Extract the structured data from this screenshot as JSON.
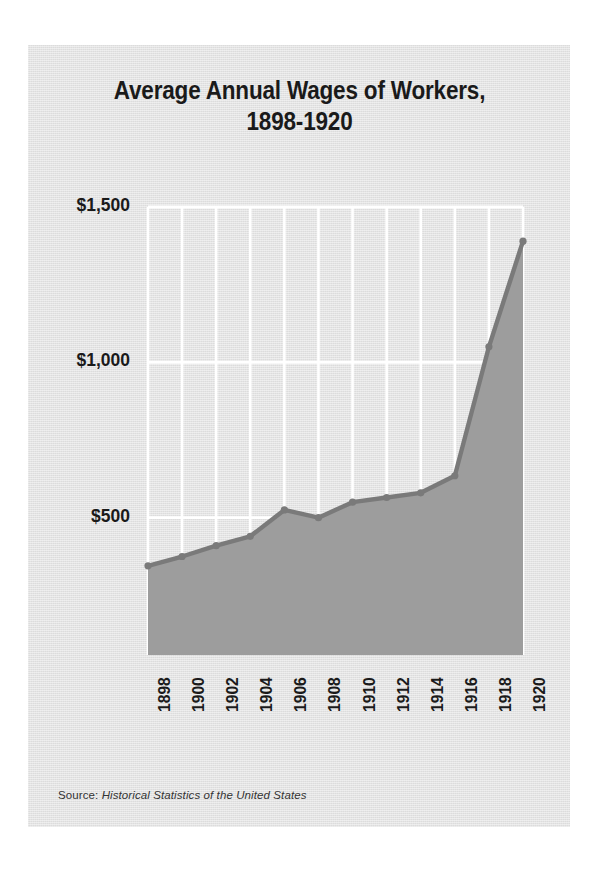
{
  "figure": {
    "title_line1": "Average Annual Wages of Workers,",
    "title_line2": "1898-1920",
    "title_full": "Average Annual Wages of Workers, 1898-1920",
    "source_prefix": "Source:",
    "source_work": "Historical Statistics of the United States",
    "background_color": "#e2e2e2",
    "page_color": "#ffffff",
    "series_line_color": "#7a7a7a",
    "series_fill_color": "#9d9d9d",
    "gridline_color": "#ffffff",
    "text_color": "#1a1a1a"
  },
  "chart_data": {
    "type": "area",
    "title": "Average Annual Wages of Workers, 1898-1920",
    "xlabel": "",
    "ylabel": "",
    "x": [
      1898,
      1900,
      1902,
      1904,
      1906,
      1908,
      1910,
      1912,
      1914,
      1916,
      1918,
      1920
    ],
    "values": [
      345,
      375,
      410,
      440,
      525,
      500,
      550,
      565,
      580,
      635,
      1050,
      1390
    ],
    "series": [
      {
        "name": "Average annual wages",
        "values": [
          345,
          375,
          410,
          440,
          525,
          500,
          550,
          565,
          580,
          635,
          1050,
          1390
        ]
      }
    ],
    "xtick_labels": [
      "1898",
      "1900",
      "1902",
      "1904",
      "1906",
      "1908",
      "1910",
      "1912",
      "1914",
      "1916",
      "1918",
      "1920"
    ],
    "ytick_values": [
      500,
      1000,
      1500
    ],
    "ytick_labels": [
      "$500",
      "$1,000",
      "$1,500"
    ],
    "xlim": [
      1898,
      1920
    ],
    "ylim": [
      58,
      1500
    ],
    "grid": "vertical-and-horizontal-white",
    "legend": "none",
    "marker": "circle",
    "xtick_rotation": -90
  }
}
